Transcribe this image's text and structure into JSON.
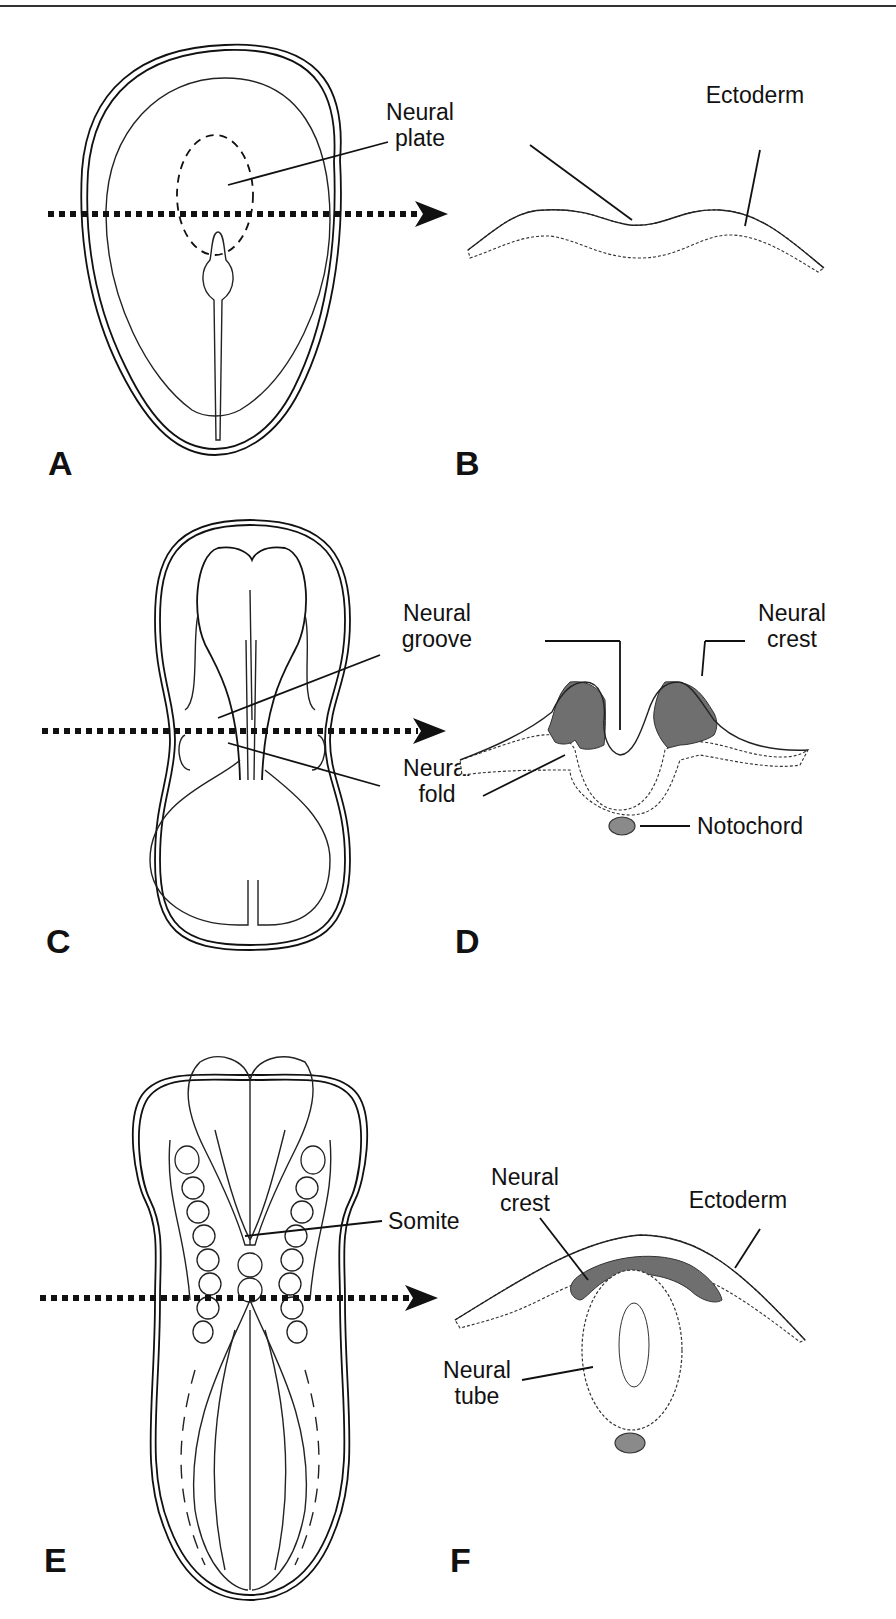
{
  "figure": {
    "panels": [
      {
        "id": "A",
        "label": "A",
        "view": "dorsal view, neural plate stage"
      },
      {
        "id": "B",
        "label": "B",
        "view": "cross-section, neural plate"
      },
      {
        "id": "C",
        "label": "C",
        "view": "dorsal view, neural groove stage"
      },
      {
        "id": "D",
        "label": "D",
        "view": "cross-section, neural groove"
      },
      {
        "id": "E",
        "label": "E",
        "view": "dorsal view, somite stage"
      },
      {
        "id": "F",
        "label": "F",
        "view": "cross-section, neural tube"
      }
    ],
    "labels": {
      "a_neural_plate_1": "Neural",
      "a_neural_plate_2": "plate",
      "b_ectoderm": "Ectoderm",
      "c_neural_groove_1": "Neural",
      "c_neural_groove_2": "groove",
      "c_neural_fold_1": "Neural",
      "c_neural_fold_2": "fold",
      "d_neural_crest_1": "Neural",
      "d_neural_crest_2": "crest",
      "d_notochord": "Notochord",
      "e_somite": "Somite",
      "f_neural_crest_1": "Neural",
      "f_neural_crest_2": "crest",
      "f_ectoderm": "Ectoderm",
      "f_neural_tube_1": "Neural",
      "f_neural_tube_2": "tube"
    },
    "colors": {
      "line": "#111111",
      "neural_crest_fill": "#6f6f6f",
      "notochord_fill": "#8a8a8a",
      "background": "#ffffff"
    }
  }
}
